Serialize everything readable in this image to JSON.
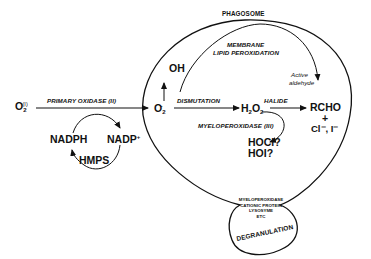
{
  "diagram": {
    "type": "biochemical-pathway",
    "compartments": {
      "phagosome": "PHAGOSOME",
      "degranulation": "DEGRANULATION"
    },
    "granule_contents": [
      "MYELOPEROXIDASE",
      "CATIONIC PROTEIN",
      "LYSOSYME",
      "ETC"
    ],
    "species": {
      "o2_main": "O",
      "o2_sub": "2",
      "o2_sup": "(I)",
      "superoxide_main": "O",
      "superoxide_sub": "2",
      "superoxide_sup": "-",
      "oh": "OH",
      "h2o2_a": "H",
      "h2o2_sub1": "2",
      "h2o2_b": "O",
      "h2o2_sub2": "2",
      "rcho": "RCHO",
      "plus": "+",
      "halide_ions": "Cl⁻, I⁻",
      "hocl": "HOCl?",
      "hoi": "HOI?",
      "nadph": "NADPH",
      "nadp": "NADP",
      "nadp_sup": "+",
      "hmps": "HMPS"
    },
    "edges": {
      "primary_oxidase": "PRIMARY OXIDASE (II)",
      "dismutation": "DISMUTATION",
      "halide": "HALIDE",
      "myeloperoxidase": "MYELOPEROXIDASE (III)",
      "membrane": "MEMBRANE",
      "lipid_peroxidation": "LIPID PEROXIDATION",
      "active": "Active",
      "aldehyde": "aldehyde"
    },
    "colors": {
      "ink": "#111111",
      "background": "#ffffff"
    }
  }
}
